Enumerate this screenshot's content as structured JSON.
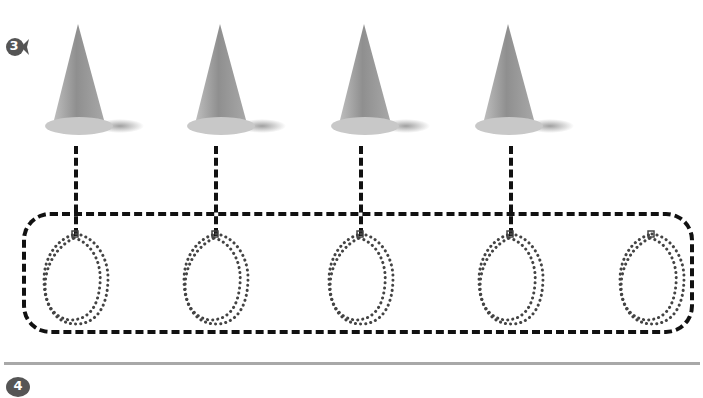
{
  "worksheet": {
    "section_3": {
      "number": "3",
      "badge_color": "#555555"
    },
    "section_4": {
      "number": "4",
      "badge_color": "#555555"
    },
    "cones": [
      {
        "x": 38,
        "label": "cone-1"
      },
      {
        "x": 180,
        "label": "cone-2"
      },
      {
        "x": 322,
        "label": "cone-3"
      },
      {
        "x": 466,
        "label": "cone-4"
      }
    ],
    "loops": [
      {
        "x": 36
      },
      {
        "x": 176
      },
      {
        "x": 322
      },
      {
        "x": 466
      },
      {
        "x": 610
      }
    ],
    "colors": {
      "dash": "#111111",
      "bead": "#444444",
      "divider": "#a8a8a8",
      "cone_body": "#9a9a9a",
      "cone_base": "#c4c4c4"
    }
  }
}
